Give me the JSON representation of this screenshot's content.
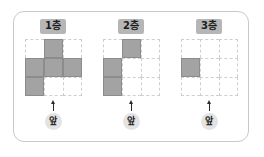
{
  "figure": {
    "title": "",
    "grid_rows": 3,
    "grid_cols": 3,
    "colors": {
      "frame_border": "#c9c9c9",
      "grid_line": "#cfcfcf",
      "cube_fill": "#a3a3a3",
      "cube_border": "#8c8c8c",
      "floor_badge_bg": "#b6b6b6",
      "front_badge_bg": "#e3e3e3",
      "arrow": "#2b2b2b",
      "background": "#ffffff"
    },
    "arrow_icon": "up-arrow-icon",
    "panels": [
      {
        "floor_label": "1층",
        "front_label": "앞",
        "cells": [
          [
            0,
            1,
            0
          ],
          [
            1,
            1,
            1
          ],
          [
            1,
            0,
            0
          ]
        ],
        "filled_count": 5
      },
      {
        "floor_label": "2층",
        "front_label": "앞",
        "cells": [
          [
            0,
            1,
            0
          ],
          [
            1,
            0,
            0
          ],
          [
            1,
            0,
            0
          ]
        ],
        "filled_count": 3
      },
      {
        "floor_label": "3층",
        "front_label": "앞",
        "cells": [
          [
            0,
            0,
            0
          ],
          [
            1,
            0,
            0
          ],
          [
            0,
            0,
            0
          ]
        ],
        "filled_count": 1
      }
    ]
  }
}
